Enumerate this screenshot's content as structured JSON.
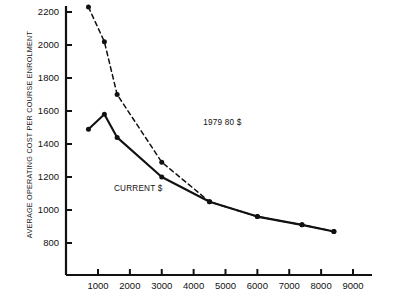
{
  "chart_data": {
    "type": "line",
    "title": "",
    "xlabel": "",
    "ylabel": "AVERAGE OPERATING COST PER COURSE ENROLMENT",
    "xlim": [
      0,
      9300
    ],
    "ylim": [
      760,
      2260
    ],
    "xticks": [
      1000,
      2000,
      3000,
      4000,
      5000,
      6000,
      7000,
      8000,
      9000
    ],
    "yticks": [
      800,
      1000,
      1200,
      1400,
      1600,
      1800,
      2000,
      2200
    ],
    "grid": false,
    "legend_position": "inline-annotations",
    "series": [
      {
        "name": "1979 80 $",
        "style": "dashed",
        "marker": "circle",
        "color": "#111111",
        "points": [
          [
            700,
            2230
          ],
          [
            1200,
            2020
          ],
          [
            1600,
            1700
          ],
          [
            3000,
            1290
          ],
          [
            4500,
            1050
          ],
          [
            6000,
            960
          ],
          [
            7400,
            910
          ],
          [
            8400,
            870
          ]
        ]
      },
      {
        "name": "CURRENT $",
        "style": "solid",
        "marker": "circle",
        "color": "#111111",
        "points": [
          [
            700,
            1490
          ],
          [
            1200,
            1580
          ],
          [
            1600,
            1440
          ],
          [
            3000,
            1200
          ],
          [
            4500,
            1050
          ],
          [
            6000,
            960
          ],
          [
            7400,
            910
          ],
          [
            8400,
            870
          ]
        ]
      }
    ],
    "annotations": [
      {
        "text": "1979 80 $",
        "x": 4300,
        "y": 1530
      },
      {
        "text": "CURRENT $",
        "x": 1500,
        "y": 1130
      }
    ]
  },
  "axis": {
    "y_title": "AVERAGE OPERATING COST PER COURSE ENROLMENT",
    "y_tick_labels": [
      "2200",
      "2000",
      "1800",
      "1600",
      "1400",
      "1200",
      "1000",
      "800"
    ],
    "x_tick_labels": [
      "1000",
      "2000",
      "3000",
      "4000",
      "5000",
      "6000",
      "7000",
      "8000",
      "9000"
    ]
  },
  "labels": {
    "series_a": "1979 80 $",
    "series_b": "CURRENT $"
  },
  "colors": {
    "ink": "#111111",
    "background": "#ffffff"
  }
}
